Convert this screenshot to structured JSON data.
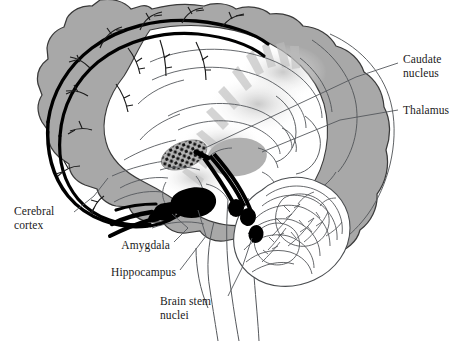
{
  "figure": {
    "kind": "anatomical-diagram",
    "background_color": "#ffffff",
    "outline_color": "#3c3c3c",
    "cortex_fill": "#a8a8a8",
    "thalamus_fill": "#b0b0b0",
    "caudate_fill": "#b5b5b5",
    "tract_color": "#000000",
    "white_matter_fill": "#ffffff",
    "radiation_fill": "#c9c9c9"
  },
  "labels": [
    {
      "id": "caudate-nucleus",
      "line1": "Caudate",
      "line2": "nucleus",
      "align": "left",
      "x": 403,
      "y": 53
    },
    {
      "id": "thalamus",
      "line1": "Thalamus",
      "line2": "",
      "align": "left",
      "x": 403,
      "y": 104
    },
    {
      "id": "cerebral-cortex",
      "line1": "Cerebral",
      "line2": "cortex",
      "align": "left",
      "x": 14,
      "y": 205
    },
    {
      "id": "amygdala",
      "line1": "Amygdala",
      "line2": "",
      "align": "right",
      "x": 110,
      "y": 239
    },
    {
      "id": "hippocampus",
      "line1": "Hippocampus",
      "line2": "",
      "align": "right",
      "x": 96,
      "y": 266
    },
    {
      "id": "brain-stem-nuclei",
      "line1": "Brain stem",
      "line2": "nuclei",
      "align": "left",
      "x": 160,
      "y": 295
    }
  ],
  "structures": [
    {
      "id": "cerebral-cortex",
      "name": "Cerebral cortex",
      "render": "gray-gyral-band"
    },
    {
      "id": "caudate-nucleus",
      "name": "Caudate nucleus",
      "render": "stippled-gray-ellipse"
    },
    {
      "id": "thalamus",
      "name": "Thalamus",
      "render": "solid-gray-ellipse"
    },
    {
      "id": "hippocampus",
      "name": "Hippocampus",
      "render": "black-elongated-blob"
    },
    {
      "id": "amygdala",
      "name": "Amygdala",
      "render": "black-round-blob"
    },
    {
      "id": "brain-stem-nuclei",
      "name": "Brain stem nuclei",
      "render": "black-oval-cluster"
    },
    {
      "id": "cerebellum",
      "name": "Cerebellum",
      "render": "arbor-vitae-outline"
    },
    {
      "id": "brainstem",
      "name": "Brainstem / spinal cord",
      "render": "outline-tube"
    },
    {
      "id": "corpus-callosum",
      "name": "Corpus callosum",
      "render": "white-matter-outline"
    }
  ]
}
